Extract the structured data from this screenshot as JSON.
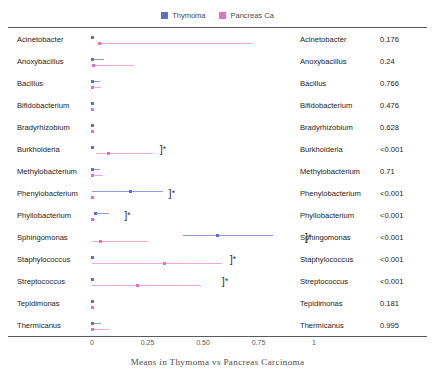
{
  "legend": {
    "entries": [
      {
        "label": "Thymoma",
        "color": "#5c70c8",
        "icon": "legend-swatch-icon"
      },
      {
        "label": "Pancreas Ca",
        "color": "#e56fc0",
        "icon": "legend-swatch-icon"
      }
    ]
  },
  "caption": "Means in Thymoma vs Pancreas Carcinoma",
  "chart_data": {
    "type": "scatter",
    "title": "Means in Thymoma vs Pancreas Carcinoma",
    "xlabel": "",
    "ylabel": "",
    "xlim": [
      0,
      1.05
    ],
    "xticks": [
      "0",
      "0.25",
      "0.50",
      "0.75",
      "1"
    ],
    "xtick_values": [
      0,
      0.25,
      0.5,
      0.75,
      1
    ],
    "grid": false,
    "legend_position": "top-center",
    "series_names": [
      "Thymoma",
      "Pancreas Ca"
    ],
    "categories": [
      "Acinetobacter",
      "Anoxybacillus",
      "Bacillus",
      "Bifidobacterium",
      "Bradyrhizobium",
      "Burkholderia",
      "Methylobacterium",
      "Phenylobacterium",
      "Phyllobacterium",
      "Sphingomonas",
      "Staphylococcus",
      "Streptococcus",
      "Tepidimonas",
      "Thermicanus"
    ],
    "rows": [
      {
        "label": "Acinetobacter",
        "pvalue": "0.176",
        "significant": false,
        "thymoma": {
          "mean": 0.0,
          "low": 0.0,
          "high": 0.0
        },
        "pancreas": {
          "mean": 0.035,
          "low": 0.035,
          "high": 0.72
        }
      },
      {
        "label": "Anoxybacillus",
        "pvalue": "0.24",
        "significant": false,
        "thymoma": {
          "mean": 0.0,
          "low": 0.0,
          "high": 0.055
        },
        "pancreas": {
          "mean": 0.005,
          "low": 0.005,
          "high": 0.19
        }
      },
      {
        "label": "Bacillus",
        "pvalue": "0.766",
        "significant": false,
        "thymoma": {
          "mean": 0.0,
          "low": 0.0,
          "high": 0.035
        },
        "pancreas": {
          "mean": 0.0,
          "low": 0.0,
          "high": 0.04
        }
      },
      {
        "label": "Bifidobacterium",
        "pvalue": "0.476",
        "significant": false,
        "thymoma": {
          "mean": 0.0,
          "low": 0.0,
          "high": 0.0
        },
        "pancreas": {
          "mean": 0.0,
          "low": 0.0,
          "high": 0.0
        }
      },
      {
        "label": "Bradyrhizobium",
        "pvalue": "0.628",
        "significant": false,
        "thymoma": {
          "mean": 0.0,
          "low": 0.0,
          "high": 0.0
        },
        "pancreas": {
          "mean": 0.0,
          "low": 0.0,
          "high": 0.0
        }
      },
      {
        "label": "Burkholderia",
        "pvalue": "<0.001",
        "significant": true,
        "bracket_x": 0.305,
        "thymoma": {
          "mean": 0.0,
          "low": 0.0,
          "high": 0.0
        },
        "pancreas": {
          "mean": 0.075,
          "low": 0.02,
          "high": 0.275
        }
      },
      {
        "label": "Methylobacterium",
        "pvalue": "0.71",
        "significant": false,
        "thymoma": {
          "mean": 0.0,
          "low": 0.0,
          "high": 0.035
        },
        "pancreas": {
          "mean": 0.0,
          "low": 0.0,
          "high": 0.05
        }
      },
      {
        "label": "Phenylobacterium",
        "pvalue": "<0.001",
        "significant": true,
        "bracket_x": 0.345,
        "thymoma": {
          "mean": 0.175,
          "low": 0.0,
          "high": 0.32
        },
        "pancreas": {
          "mean": 0.0,
          "low": 0.0,
          "high": 0.0
        }
      },
      {
        "label": "Phyllobacterium",
        "pvalue": "<0.001",
        "significant": true,
        "bracket_x": 0.145,
        "thymoma": {
          "mean": 0.015,
          "low": 0.01,
          "high": 0.075
        },
        "pancreas": {
          "mean": 0.0,
          "low": 0.0,
          "high": 0.015
        }
      },
      {
        "label": "Sphingomonas",
        "pvalue": "<0.001",
        "significant": true,
        "bracket_x": 0.96,
        "thymoma": {
          "mean": 0.565,
          "low": 0.41,
          "high": 0.815
        },
        "pancreas": {
          "mean": 0.04,
          "low": 0.0,
          "high": 0.25
        }
      },
      {
        "label": "Staphylococcus",
        "pvalue": "<0.001",
        "significant": true,
        "bracket_x": 0.62,
        "thymoma": {
          "mean": 0.0,
          "low": 0.0,
          "high": 0.0
        },
        "pancreas": {
          "mean": 0.325,
          "low": 0.0,
          "high": 0.585
        }
      },
      {
        "label": "Streptococcus",
        "pvalue": "<0.001",
        "significant": true,
        "bracket_x": 0.585,
        "thymoma": {
          "mean": 0.0,
          "low": 0.0,
          "high": 0.0
        },
        "pancreas": {
          "mean": 0.205,
          "low": 0.0,
          "high": 0.49
        }
      },
      {
        "label": "Tepidimonas",
        "pvalue": "0.181",
        "significant": false,
        "thymoma": {
          "mean": 0.0,
          "low": 0.0,
          "high": 0.0
        },
        "pancreas": {
          "mean": 0.0,
          "low": 0.0,
          "high": 0.0
        }
      },
      {
        "label": "Thermicanus",
        "pvalue": "0.995",
        "significant": true,
        "bracket_x": null,
        "thymoma": {
          "mean": 0.0,
          "low": 0.0,
          "high": 0.04
        },
        "pancreas": {
          "mean": 0.0,
          "low": 0.0,
          "high": 0.075
        }
      }
    ]
  }
}
